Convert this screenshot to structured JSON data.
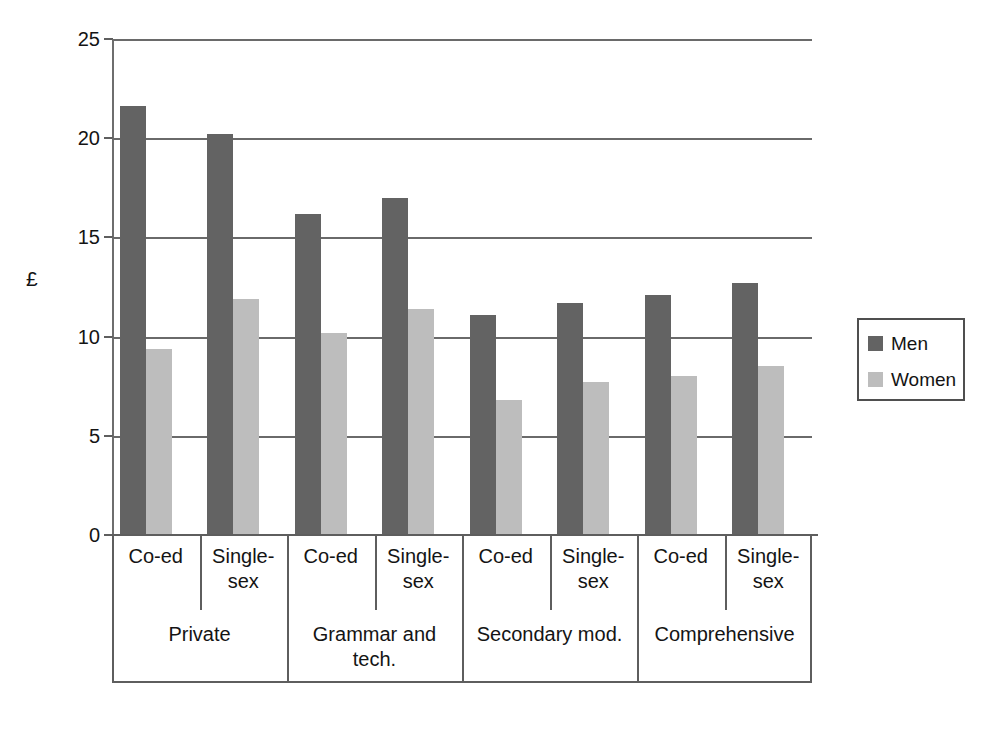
{
  "chart_data": {
    "type": "bar",
    "title": "",
    "xlabel": "",
    "ylabel": "£",
    "ylim": [
      0,
      25
    ],
    "yticks": [
      0,
      5,
      10,
      15,
      20,
      25
    ],
    "ytick_labels": [
      "0",
      "5",
      "10",
      "15",
      "20",
      "25"
    ],
    "grid": true,
    "legend_position": "right",
    "group_labels": [
      "Private",
      "Grammar and tech.",
      "Secondary mod.",
      "Comprehensive"
    ],
    "categories": [
      "Private / Co-ed",
      "Private / Single-sex",
      "Grammar and tech. / Co-ed",
      "Grammar and tech. / Single-sex",
      "Secondary mod. / Co-ed",
      "Secondary mod. / Single-sex",
      "Comprehensive / Co-ed",
      "Comprehensive / Single-sex"
    ],
    "subcategories": [
      "Co-ed",
      "Single-sex",
      "Co-ed",
      "Single-sex",
      "Co-ed",
      "Single-sex",
      "Co-ed",
      "Single-sex"
    ],
    "series": [
      {
        "name": "Men",
        "color": "#636363",
        "values": [
          21.6,
          20.2,
          16.2,
          17.0,
          11.1,
          11.7,
          12.1,
          12.7
        ]
      },
      {
        "name": "Women",
        "color": "#bdbdbd",
        "values": [
          9.4,
          11.9,
          10.2,
          11.4,
          6.8,
          7.7,
          8.0,
          8.5
        ]
      }
    ]
  },
  "axis": {
    "y_title": "£",
    "tick_labels": [
      "25",
      "20",
      "15",
      "10",
      "5",
      "0"
    ]
  },
  "xaxis": {
    "sub_labels": [
      "Co-ed",
      "Single-\nsex",
      "Co-ed",
      "Single-\nsex",
      "Co-ed",
      "Single-\nsex",
      "Co-ed",
      "Single-\nsex"
    ],
    "sub_labels_line1": [
      "Co-ed",
      "Single-",
      "Co-ed",
      "Single-",
      "Co-ed",
      "Single-",
      "Co-ed",
      "Single-"
    ],
    "sub_labels_line2": [
      "",
      "sex",
      "",
      "sex",
      "",
      "sex",
      "",
      "sex"
    ],
    "category_labels": [
      "Private",
      "Grammar and tech.",
      "Secondary mod.",
      "Comprehensive"
    ]
  },
  "legend": {
    "items": [
      {
        "label": "Men",
        "color": "#636363"
      },
      {
        "label": "Women",
        "color": "#bdbdbd"
      }
    ]
  }
}
